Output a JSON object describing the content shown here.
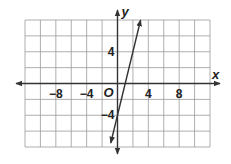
{
  "chart_data": {
    "type": "line",
    "title": "",
    "xlabel": "x",
    "ylabel": "y",
    "origin_label": "O",
    "xlim": [
      -12,
      12
    ],
    "ylim": [
      -8,
      8
    ],
    "grid": true,
    "grid_step": 2,
    "x_ticks": [
      {
        "value": -8,
        "label": "−8"
      },
      {
        "value": -4,
        "label": "−4"
      },
      {
        "value": 4,
        "label": "4"
      },
      {
        "value": 8,
        "label": "8"
      }
    ],
    "y_ticks": [
      {
        "value": 4,
        "label": "4"
      },
      {
        "value": -4,
        "label": "−4"
      }
    ],
    "series": [
      {
        "name": "line",
        "equation": "y = 4x - 4",
        "slope": 4,
        "intercept": -4,
        "x": [
          -0.875,
          3
        ],
        "y": [
          -7.5,
          8
        ],
        "arrows": "both"
      }
    ]
  }
}
